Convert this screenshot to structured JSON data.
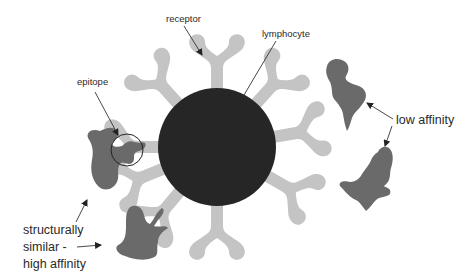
{
  "diagram": {
    "title": "",
    "labels": {
      "receptor": "receptor",
      "lymphocyte": "lymphocyte",
      "epitope": "epitope",
      "low_affinity": "low affinity",
      "high_affinity_line1": "structurally",
      "high_affinity_line2": "similar -",
      "high_affinity_line3": "high affinity"
    },
    "nodes": [
      {
        "id": "lymphocyte",
        "type": "circle",
        "label": "lymphocyte",
        "color": "#262626"
      },
      {
        "id": "receptors",
        "type": "y-shaped-receptor",
        "count": 10,
        "label": "receptor",
        "color": "#c4c4c4"
      },
      {
        "id": "antigen-bound",
        "type": "antigen",
        "label": "epitope",
        "color": "#6a6a6a"
      },
      {
        "id": "antigen-high-affinity",
        "type": "antigen",
        "label": "structurally similar - high affinity",
        "color": "#6a6a6a"
      },
      {
        "id": "antigen-low-affinity-1",
        "type": "antigen",
        "label": "low affinity",
        "color": "#6a6a6a"
      },
      {
        "id": "antigen-low-affinity-2",
        "type": "antigen",
        "label": "low affinity",
        "color": "#6a6a6a"
      }
    ],
    "colors": {
      "background": "#ffffff",
      "cell": "#262626",
      "receptor": "#c4c4c4",
      "antigen": "#6a6a6a",
      "text": "#2a2a2a"
    }
  }
}
